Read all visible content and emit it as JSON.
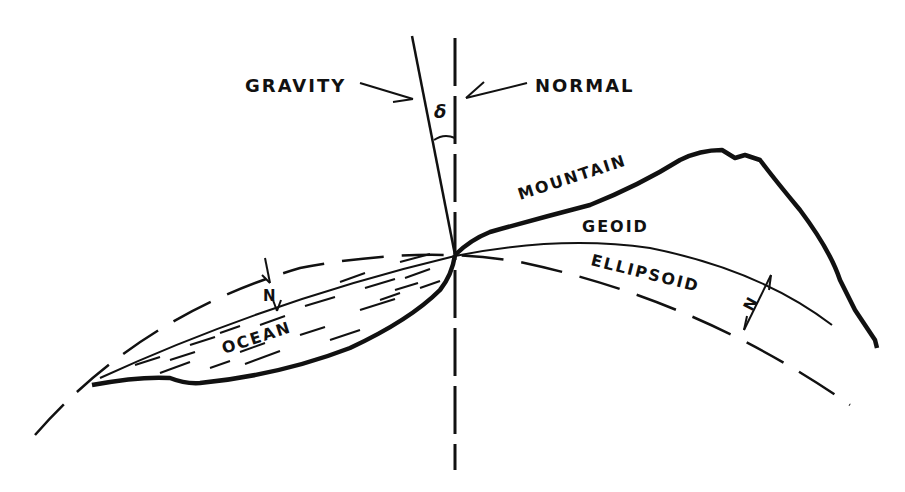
{
  "diagram": {
    "labels": {
      "gravity": "GRAVITY",
      "normal": "NORMAL",
      "delta": "δ",
      "mountain": "MOUNTAIN",
      "geoid": "GEOID",
      "ellipsoid": "ELLIPSOID",
      "ocean": "OCEAN",
      "n_ocean": "N",
      "n_land": "N"
    },
    "elements": [
      {
        "id": "gravity-line",
        "style": "solid"
      },
      {
        "id": "normal-line",
        "style": "dashed"
      },
      {
        "id": "mountain-surface",
        "style": "bold"
      },
      {
        "id": "geoid-curve",
        "style": "thin"
      },
      {
        "id": "ellipsoid-curve",
        "style": "long-dash"
      },
      {
        "id": "ocean-floor",
        "style": "bold"
      },
      {
        "id": "ocean-water",
        "style": "dashed-hatching"
      }
    ],
    "colors": {
      "ink": "#111111",
      "background": "#ffffff"
    }
  }
}
